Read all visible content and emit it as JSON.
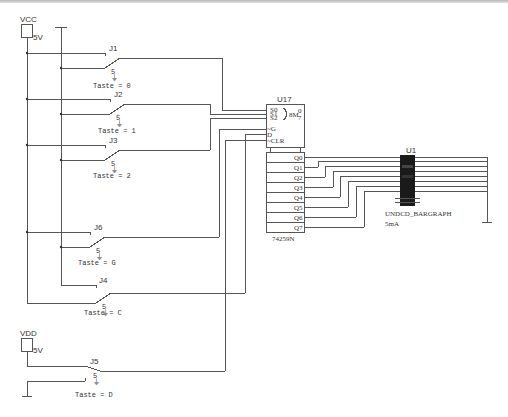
{
  "schematic": {
    "power": [
      {
        "name": "VCC",
        "value": "5V"
      },
      {
        "name": "VDD",
        "value": "5V"
      }
    ],
    "switches": [
      {
        "ref": "J1",
        "key": "Taste = 0"
      },
      {
        "ref": "J2",
        "key": "Taste = 1"
      },
      {
        "ref": "J3",
        "key": "Taste = 2"
      },
      {
        "ref": "J6",
        "key": "Taste = G"
      },
      {
        "ref": "J4",
        "key": "Taste = C"
      },
      {
        "ref": "J5",
        "key": "Taste = D"
      }
    ],
    "u17": {
      "ref": "U17",
      "part": "74259N",
      "inputs": [
        "S0",
        "S1",
        "S2",
        "~G",
        "D",
        "~CLR"
      ],
      "mux_label": "8M",
      "mux_range_top": "0",
      "mux_range_bottom": "7",
      "outputs": [
        "Q0",
        "Q1",
        "Q2",
        "Q3",
        "Q4",
        "Q5",
        "Q6",
        "Q7"
      ]
    },
    "u1": {
      "ref": "U1",
      "part": "UNDCD_BARGRAPH",
      "current": "5mA"
    }
  }
}
